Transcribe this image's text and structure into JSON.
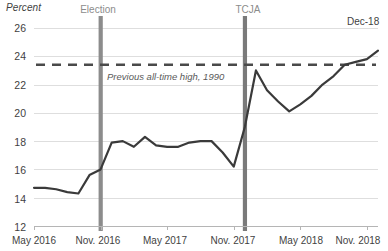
{
  "chart_data": {
    "type": "line",
    "title": "",
    "xlabel": "",
    "ylabel": "Percent",
    "ylim": [
      12,
      26
    ],
    "ytick_step": 2,
    "yticks": [
      "26",
      "24",
      "22",
      "20",
      "18",
      "16",
      "14",
      "12"
    ],
    "grid": "horizontal",
    "legend": "none",
    "x": [
      "May 2016",
      "Jun 2016",
      "Jul 2016",
      "Aug 2016",
      "Sep 2016",
      "Oct 2016",
      "Nov. 2016",
      "Dec 2016",
      "Jan 2017",
      "Feb 2017",
      "Mar 2017",
      "Apr 2017",
      "May 2017",
      "Jun 2017",
      "Jul 2017",
      "Aug 2017",
      "Sep 2017",
      "Oct 2017",
      "Nov. 2017",
      "Dec 2017",
      "Jan 2018",
      "Feb 2018",
      "Mar 2018",
      "Apr 2018",
      "May 2018",
      "Jun 2018",
      "Jul 2018",
      "Aug 2018",
      "Sep 2018",
      "Oct 2018",
      "Nov. 2018",
      "Dec 2018"
    ],
    "xticks": [
      "May 2016",
      "Nov. 2016",
      "May 2017",
      "Nov. 2017",
      "May 2018",
      "Nov. 2018"
    ],
    "values": [
      14.7,
      14.7,
      14.6,
      14.4,
      14.3,
      15.6,
      16.0,
      17.9,
      18.0,
      17.6,
      18.3,
      17.7,
      17.6,
      17.6,
      17.9,
      18.0,
      18.0,
      17.2,
      16.2,
      19.0,
      23.0,
      21.6,
      20.8,
      20.1,
      20.6,
      21.2,
      22.0,
      22.6,
      23.4,
      23.6,
      23.8,
      24.4
    ],
    "series_name": "Percent",
    "line_color": "#3a3a3a",
    "threshold": {
      "value": 23.4,
      "label": "Previous all-time high, 1990",
      "style": "dashed",
      "color": "#4a4a4a"
    },
    "event_markers": [
      {
        "label": "Election",
        "x": "Nov. 2016",
        "color": "#8c8c8c"
      },
      {
        "label": "TCJA",
        "x": "Dec 2017",
        "color": "#7a7a7a"
      }
    ],
    "annotations": [
      {
        "label": "Dec-18",
        "x": "Dec 2018",
        "value": 24.4
      }
    ],
    "colors": {
      "line": "#3a3a3a",
      "grid": "#dedede",
      "axis": "#b5b5b5",
      "text": "#3f3f3f",
      "muted_text": "#8c8c8c",
      "band": "#8c8c8c",
      "background": "#ffffff"
    }
  }
}
